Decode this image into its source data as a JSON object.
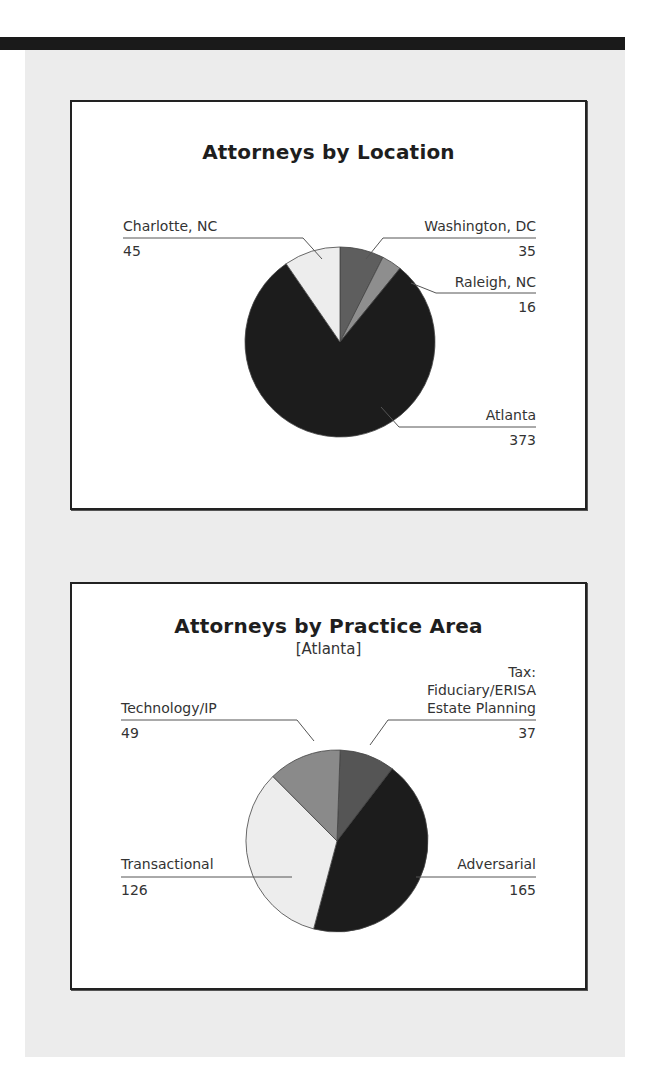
{
  "chart_data": [
    {
      "type": "pie",
      "title": "Attorneys by Location",
      "subtitle": "",
      "categories": [
        "Atlanta",
        "Charlotte, NC",
        "Washington, DC",
        "Raleigh, NC"
      ],
      "values": [
        373,
        45,
        35,
        16
      ],
      "colors": [
        "#1c1c1c",
        "#ededed",
        "#5e5e5e",
        "#8e8e8e"
      ],
      "labels": [
        {
          "name": "Charlotte, NC",
          "value": "45"
        },
        {
          "name": "Washington, DC",
          "value": "35"
        },
        {
          "name": "Raleigh, NC",
          "value": "16"
        },
        {
          "name": "Atlanta",
          "value": "373"
        }
      ],
      "legend": "none (leader-line labels)"
    },
    {
      "type": "pie",
      "title": "Attorneys by Practice Area",
      "subtitle": "[Atlanta]",
      "categories": [
        "Adversarial",
        "Transactional",
        "Technology/IP",
        "Tax: Fiduciary/ERISA Estate Planning"
      ],
      "values": [
        165,
        126,
        49,
        37
      ],
      "colors": [
        "#1c1c1c",
        "#ededed",
        "#8a8a8a",
        "#555555"
      ],
      "labels": [
        {
          "name": "Technology/IP",
          "value": "49"
        },
        {
          "name_lines": [
            "Tax:",
            "Fiduciary/ERISA",
            "Estate Planning"
          ],
          "value": "37"
        },
        {
          "name": "Transactional",
          "value": "126"
        },
        {
          "name": "Adversarial",
          "value": "165"
        }
      ],
      "legend": "none (leader-line labels)"
    }
  ]
}
